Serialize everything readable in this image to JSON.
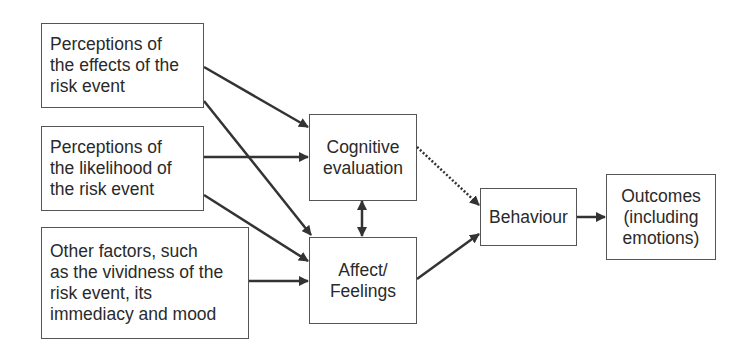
{
  "diagram": {
    "nodes": [
      {
        "id": "effects",
        "label": "Perceptions of\nthe effects of the\nrisk event"
      },
      {
        "id": "likelihood",
        "label": "Perceptions of\nthe likelihood of\nthe risk event"
      },
      {
        "id": "other",
        "label": "Other factors, such\nas the vividness of the\nrisk event, its\nimmediacy and mood"
      },
      {
        "id": "cognitive",
        "label": "Cognitive\nevaluation"
      },
      {
        "id": "affect",
        "label": "Affect/\nFeelings"
      },
      {
        "id": "behaviour",
        "label": "Behaviour"
      },
      {
        "id": "outcomes",
        "label": "Outcomes\n(including\nemotions)"
      }
    ],
    "edges": [
      {
        "from": "effects",
        "to": "cognitive",
        "style": "solid"
      },
      {
        "from": "effects",
        "to": "affect",
        "style": "solid"
      },
      {
        "from": "likelihood",
        "to": "cognitive",
        "style": "solid"
      },
      {
        "from": "likelihood",
        "to": "affect",
        "style": "solid"
      },
      {
        "from": "other",
        "to": "affect",
        "style": "solid"
      },
      {
        "from": "cognitive",
        "to": "affect",
        "style": "bidirectional"
      },
      {
        "from": "cognitive",
        "to": "behaviour",
        "style": "dotted"
      },
      {
        "from": "affect",
        "to": "behaviour",
        "style": "solid"
      },
      {
        "from": "behaviour",
        "to": "outcomes",
        "style": "solid"
      }
    ]
  }
}
